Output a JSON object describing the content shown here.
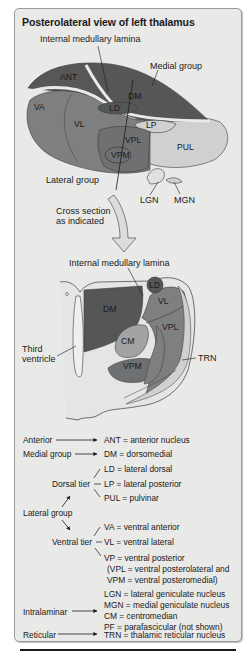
{
  "panel": {
    "title": "Posterolateral view of left thalamus",
    "background": "#e9e9e8",
    "border": "#9a9a9a"
  },
  "colors": {
    "dark_nucleus": "#555656",
    "mid_nucleus": "#7e7f80",
    "light_nucleus": "#a2a3a4",
    "pale_nucleus": "#cfd0d0",
    "lamina": "#e9e9e8",
    "outline": "#3a3a3a"
  },
  "top_view": {
    "callouts": {
      "internal_medullary_lamina": "Internal medullary lamina",
      "medial_group": "Medial group",
      "lateral_group": "Lateral group",
      "lgn": "LGN",
      "mgn": "MGN"
    },
    "nuclei": {
      "ant": "ANT",
      "dm": "DM",
      "va": "VA",
      "ld": "LD",
      "vl": "VL",
      "lp": "LP",
      "vpl": "VPL",
      "pul": "PUL",
      "vpm": "VPM"
    }
  },
  "arrow_caption": {
    "line1": "Cross section",
    "line2": "as indicated"
  },
  "cross_section": {
    "callouts": {
      "internal_medullary_lamina": "Internal medullary lamina",
      "third_ventricle_line1": "Third",
      "third_ventricle_line2": "ventricle",
      "trn": "TRN"
    },
    "nuclei": {
      "ld": "LD",
      "dm": "DM",
      "vl": "VL",
      "vpl": "VPL",
      "cm": "CM",
      "vpm": "VPM"
    }
  },
  "legend": {
    "anterior": {
      "group": "Anterior",
      "entry": "ANT = anterior nucleus"
    },
    "medial": {
      "group": "Medial group",
      "entry": "DM = dorsomedial"
    },
    "lateral_group": "Lateral group",
    "dorsal_tier": {
      "label": "Dorsal tier",
      "entries": [
        "LD = lateral dorsal",
        "LP = lateral posterior",
        "PUL = pulvinar"
      ]
    },
    "ventral_tier": {
      "label": "Ventral tier",
      "entries": [
        "VA = ventral anterior",
        "VL = ventral lateral",
        "VP = ventral posterior",
        "(VPL = ventral posterolateral and",
        "VPM = ventral posteromedial)"
      ]
    },
    "geniculate": [
      "LGN = lateral geniculate nucleus",
      "MGN = medial geniculate nucleus"
    ],
    "intralaminar": {
      "group": "Intralaminar",
      "entries": [
        "CM = centromedian",
        "PF = parafascicular (not shown)"
      ]
    },
    "reticular": {
      "group": "Reticular",
      "entry": "TRN = thalamic reticular nucleus"
    }
  }
}
